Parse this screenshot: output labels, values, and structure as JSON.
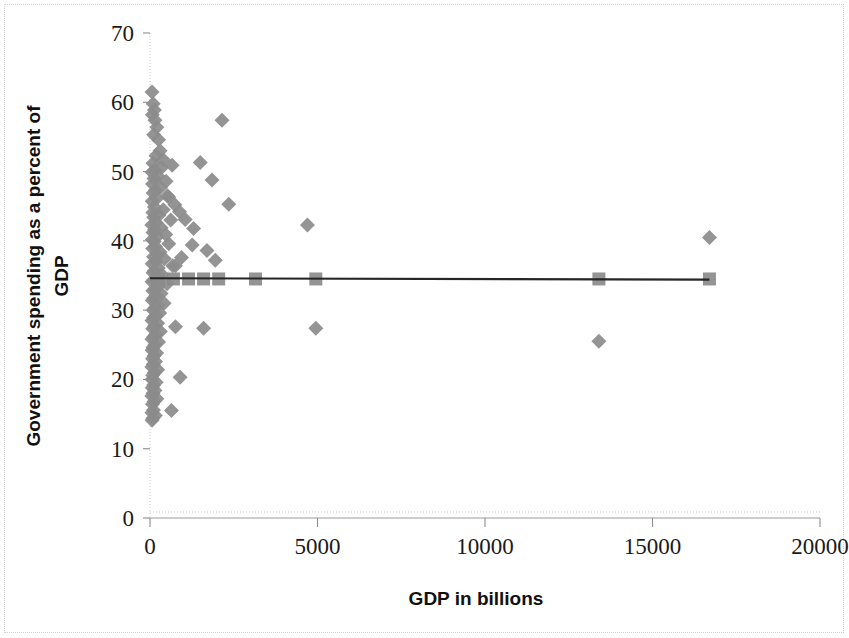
{
  "chart_data": {
    "type": "scatter",
    "title": "",
    "xlabel": "GDP in billions",
    "ylabel": "Government spending as a percent of GDP",
    "xlim": [
      0,
      20000
    ],
    "ylim": [
      0,
      70
    ],
    "xticks": [
      0,
      5000,
      10000,
      15000,
      20000
    ],
    "yticks": [
      0,
      10,
      20,
      30,
      40,
      50,
      60,
      70
    ],
    "xtick_labels": [
      "0",
      "5000",
      "10000",
      "15000",
      "20000"
    ],
    "ytick_labels": [
      "0",
      "10",
      "20",
      "30",
      "40",
      "50",
      "60",
      "70"
    ],
    "grid": false,
    "legend": false,
    "legend_position": "none",
    "marker_color": "#8b8b8b",
    "trendline_color": "#262626",
    "series": [
      {
        "name": "Countries",
        "marker": "diamond",
        "color": "#8b8b8b",
        "points": [
          [
            60,
            61.5
          ],
          [
            95,
            59.8
          ],
          [
            130,
            58.9
          ],
          [
            70,
            58.2
          ],
          [
            150,
            57.4
          ],
          [
            205,
            56.4
          ],
          [
            110,
            55.3
          ],
          [
            255,
            54.6
          ],
          [
            300,
            53.0
          ],
          [
            180,
            52.3
          ],
          [
            400,
            51.7
          ],
          [
            90,
            51.2
          ],
          [
            350,
            50.6
          ],
          [
            140,
            50.2
          ],
          [
            60,
            49.9
          ],
          [
            230,
            49.4
          ],
          [
            120,
            49.0
          ],
          [
            480,
            48.6
          ],
          [
            75,
            48.2
          ],
          [
            310,
            47.7
          ],
          [
            160,
            47.3
          ],
          [
            95,
            46.9
          ],
          [
            520,
            46.5
          ],
          [
            200,
            46.1
          ],
          [
            65,
            45.7
          ],
          [
            740,
            45.2
          ],
          [
            130,
            44.9
          ],
          [
            395,
            44.5
          ],
          [
            85,
            44.1
          ],
          [
            265,
            43.7
          ],
          [
            110,
            43.4
          ],
          [
            620,
            43.0
          ],
          [
            175,
            42.6
          ],
          [
            55,
            42.3
          ],
          [
            330,
            41.9
          ],
          [
            140,
            41.6
          ],
          [
            90,
            41.2
          ],
          [
            470,
            40.9
          ],
          [
            210,
            40.6
          ],
          [
            70,
            40.2
          ],
          [
            16700,
            40.5
          ],
          [
            125,
            39.9
          ],
          [
            560,
            39.6
          ],
          [
            160,
            39.2
          ],
          [
            80,
            38.9
          ],
          [
            2150,
            57.4
          ],
          [
            1500,
            51.3
          ],
          [
            1850,
            48.8
          ],
          [
            2350,
            45.3
          ],
          [
            4700,
            42.3
          ],
          [
            1300,
            41.8
          ],
          [
            1700,
            38.6
          ],
          [
            880,
            44.2
          ],
          [
            660,
            50.9
          ],
          [
            560,
            46.3
          ],
          [
            1050,
            43.1
          ],
          [
            1260,
            39.4
          ],
          [
            940,
            37.6
          ],
          [
            1950,
            37.2
          ],
          [
            760,
            36.4
          ],
          [
            300,
            38.4
          ],
          [
            230,
            38.0
          ],
          [
            105,
            37.7
          ],
          [
            430,
            37.4
          ],
          [
            175,
            37.0
          ],
          [
            65,
            36.7
          ],
          [
            680,
            36.4
          ],
          [
            250,
            36.1
          ],
          [
            130,
            35.7
          ],
          [
            90,
            35.4
          ],
          [
            360,
            35.1
          ],
          [
            195,
            34.8
          ],
          [
            115,
            34.4
          ],
          [
            60,
            34.1
          ],
          [
            510,
            33.8
          ],
          [
            240,
            33.4
          ],
          [
            150,
            33.1
          ],
          [
            85,
            32.8
          ],
          [
            330,
            32.4
          ],
          [
            180,
            32.1
          ],
          [
            110,
            31.7
          ],
          [
            70,
            31.4
          ],
          [
            420,
            31.0
          ],
          [
            215,
            30.7
          ],
          [
            140,
            30.3
          ],
          [
            95,
            30.0
          ],
          [
            290,
            29.6
          ],
          [
            165,
            29.2
          ],
          [
            105,
            28.9
          ],
          [
            60,
            28.5
          ],
          [
            760,
            27.6
          ],
          [
            1600,
            27.4
          ],
          [
            4950,
            27.4
          ],
          [
            13400,
            25.5
          ],
          [
            230,
            28.1
          ],
          [
            135,
            27.7
          ],
          [
            80,
            27.3
          ],
          [
            310,
            26.9
          ],
          [
            170,
            26.5
          ],
          [
            100,
            26.1
          ],
          [
            58,
            25.8
          ],
          [
            255,
            25.4
          ],
          [
            145,
            25.0
          ],
          [
            88,
            24.6
          ],
          [
            62,
            24.2
          ],
          [
            200,
            23.8
          ],
          [
            120,
            23.4
          ],
          [
            75,
            23.0
          ],
          [
            165,
            22.6
          ],
          [
            98,
            22.2
          ],
          [
            55,
            21.8
          ],
          [
            230,
            21.4
          ],
          [
            132,
            21.0
          ],
          [
            80,
            20.6
          ],
          [
            900,
            20.3
          ],
          [
            60,
            20.0
          ],
          [
            185,
            19.6
          ],
          [
            110,
            19.2
          ],
          [
            68,
            18.8
          ],
          [
            148,
            18.4
          ],
          [
            90,
            18.0
          ],
          [
            52,
            17.6
          ],
          [
            205,
            17.2
          ],
          [
            122,
            16.8
          ],
          [
            72,
            16.4
          ],
          [
            640,
            15.5
          ],
          [
            105,
            15.6
          ],
          [
            58,
            15.2
          ],
          [
            160,
            14.8
          ],
          [
            88,
            14.4
          ],
          [
            62,
            14.1
          ]
        ]
      },
      {
        "name": "Predicted / fitted",
        "marker": "square",
        "color": "#8b8b8b",
        "points": [
          [
            250,
            34.5
          ],
          [
            700,
            34.5
          ],
          [
            1150,
            34.5
          ],
          [
            1600,
            34.5
          ],
          [
            2050,
            34.5
          ],
          [
            3150,
            34.5
          ],
          [
            4950,
            34.5
          ],
          [
            13400,
            34.5
          ],
          [
            16700,
            34.5
          ]
        ]
      }
    ],
    "trendline": {
      "name": "Linear fit",
      "x_start": 0,
      "x_end": 16700,
      "y_start": 34.6,
      "y_end": 34.4
    }
  }
}
